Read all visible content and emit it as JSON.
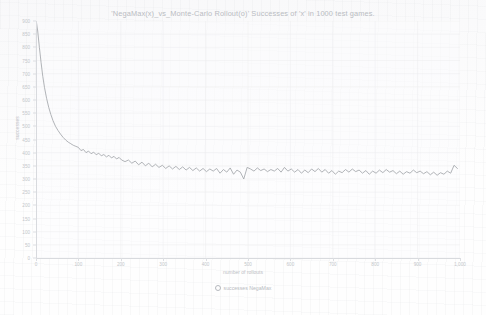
{
  "chart_data": {
    "type": "line",
    "title": "'NegaMax(x)_vs_Monte-Carlo Rollout(o)'  Successes of 'x' in 1000 test games.",
    "xlabel": "number of rollouts",
    "ylabel": "successes",
    "xlim": [
      0,
      1000
    ],
    "ylim": [
      0,
      900
    ],
    "grid": true,
    "legend_position": "bottom-center",
    "marker": "open-circle",
    "line_color": "#9b9ea3",
    "axis_color": "#d8dade",
    "text_color": "#c3c6ca",
    "xticks": [
      0,
      100,
      200,
      300,
      400,
      500,
      600,
      700,
      800,
      900,
      1000
    ],
    "xtick_labels": [
      "0",
      "100",
      "200",
      "300",
      "400",
      "500",
      "600",
      "700",
      "800",
      "900",
      "1,000"
    ],
    "yticks": [
      0,
      50,
      100,
      150,
      200,
      250,
      300,
      350,
      400,
      450,
      500,
      550,
      600,
      650,
      700,
      750,
      800,
      850,
      900
    ],
    "ytick_labels": [
      "0",
      "50",
      "100",
      "150",
      "200",
      "250",
      "300",
      "350",
      "400",
      "450",
      "500",
      "550",
      "600",
      "650",
      "700",
      "750",
      "800",
      "850",
      "900"
    ],
    "series": [
      {
        "name": "successes NegaMax",
        "x": [
          1,
          4,
          8,
          12,
          16,
          20,
          25,
          30,
          35,
          40,
          46,
          52,
          58,
          64,
          70,
          76,
          82,
          88,
          94,
          100,
          106,
          112,
          118,
          124,
          130,
          136,
          142,
          148,
          154,
          160,
          166,
          172,
          178,
          184,
          190,
          196,
          202,
          210,
          218,
          226,
          234,
          242,
          250,
          258,
          266,
          274,
          282,
          290,
          298,
          306,
          314,
          322,
          330,
          338,
          346,
          354,
          362,
          370,
          378,
          386,
          394,
          402,
          410,
          418,
          426,
          434,
          442,
          450,
          458,
          466,
          474,
          482,
          490,
          498,
          506,
          514,
          522,
          530,
          538,
          546,
          554,
          562,
          570,
          578,
          586,
          594,
          602,
          610,
          618,
          626,
          634,
          642,
          650,
          658,
          666,
          674,
          682,
          690,
          698,
          706,
          714,
          722,
          730,
          738,
          746,
          754,
          762,
          770,
          778,
          786,
          794,
          802,
          810,
          818,
          826,
          834,
          842,
          850,
          858,
          866,
          874,
          882,
          890,
          898,
          906,
          914,
          922,
          930,
          938,
          946,
          954,
          962,
          970,
          978,
          986,
          994
        ],
        "values": [
          895,
          862,
          800,
          742,
          690,
          648,
          606,
          572,
          545,
          522,
          500,
          484,
          470,
          458,
          448,
          440,
          434,
          428,
          424,
          420,
          408,
          412,
          400,
          406,
          396,
          402,
          392,
          398,
          388,
          393,
          384,
          390,
          380,
          386,
          376,
          382,
          372,
          366,
          372,
          360,
          368,
          354,
          364,
          350,
          360,
          346,
          356,
          344,
          352,
          340,
          350,
          338,
          348,
          336,
          346,
          334,
          344,
          332,
          342,
          330,
          340,
          328,
          338,
          330,
          340,
          322,
          336,
          326,
          342,
          318,
          334,
          326,
          300,
          344,
          338,
          330,
          342,
          332,
          338,
          328,
          336,
          330,
          340,
          326,
          344,
          330,
          338,
          326,
          336,
          322,
          334,
          324,
          338,
          328,
          340,
          326,
          336,
          322,
          332,
          318,
          330,
          324,
          336,
          326,
          338,
          328,
          334,
          322,
          332,
          318,
          330,
          322,
          334,
          324,
          336,
          326,
          332,
          320,
          330,
          318,
          328,
          322,
          334,
          324,
          330,
          320,
          328,
          316,
          326,
          314,
          324,
          318,
          330,
          322,
          352,
          340
        ]
      }
    ]
  },
  "legend": {
    "marker_label": "successes NegaMax"
  }
}
